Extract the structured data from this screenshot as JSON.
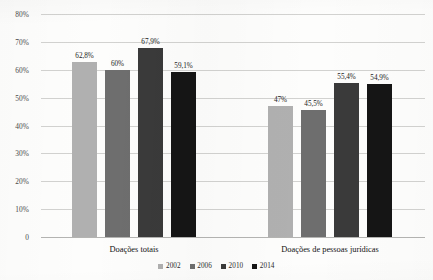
{
  "chart_data": {
    "type": "bar",
    "title": "",
    "subtitle": "",
    "xlabel": "",
    "ylabel": "",
    "categories": [
      "Doações totais",
      "Doações de pessoas jurídicas"
    ],
    "series": [
      {
        "name": "2002",
        "color": "#b0b0b0",
        "values": [
          62.8,
          47.0
        ],
        "labels": [
          "62,8%",
          "47%"
        ]
      },
      {
        "name": "2006",
        "color": "#6e6e6e",
        "values": [
          60.0,
          45.5
        ],
        "labels": [
          "60%",
          "45,5%"
        ]
      },
      {
        "name": "2010",
        "color": "#3a3a3a",
        "values": [
          67.9,
          55.4
        ],
        "labels": [
          "67,9%",
          "55,4%"
        ]
      },
      {
        "name": "2014",
        "color": "#151515",
        "values": [
          59.1,
          54.9
        ],
        "labels": [
          "59,1%",
          "54,9%"
        ]
      }
    ],
    "ylim": [
      0,
      80
    ],
    "ytick_values": [
      0,
      10,
      20,
      30,
      40,
      50,
      60,
      70,
      80
    ],
    "ytick_labels": [
      "0",
      "10%",
      "20%",
      "30%",
      "40%",
      "50%",
      "60%",
      "70%",
      "80%"
    ],
    "grid": true,
    "legend_position": "bottom",
    "gridline_color": "#d2d2d0",
    "background_color": "#fdfdfc"
  }
}
